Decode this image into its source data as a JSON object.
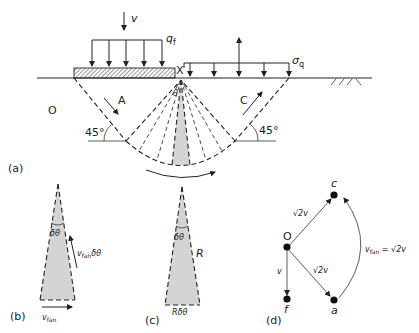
{
  "figure": {
    "panel_a": {
      "label": "(a)",
      "load_velocity": "v",
      "footing_pressure": "q",
      "footing_pressure_sub": "f",
      "point_x": "X",
      "surcharge": "σ",
      "surcharge_sub": "q",
      "origin": "O",
      "zone_a": "A",
      "zone_c": "C",
      "fan_angle": "θ",
      "angle_left": "45°",
      "angle_right": "45°"
    },
    "panel_b": {
      "label": "(b)",
      "wedge_angle": "δθ",
      "side_velocity": "v",
      "side_velocity_sub": "fan",
      "side_velocity_suffix": "δθ",
      "base_velocity": "v",
      "base_velocity_sub": "fan"
    },
    "panel_c": {
      "label": "(c)",
      "wedge_angle": "δθ",
      "radius": "R",
      "arc_length": "Rδθ"
    },
    "panel_d": {
      "label": "(d)",
      "node_o": "O",
      "node_c": "c",
      "node_a": "a",
      "node_f": "f",
      "edge_oc": "√2v",
      "edge_oa": "√2v",
      "edge_of": "v",
      "edge_ac_prefix": "v",
      "edge_ac_sub": "fan",
      "edge_ac_suffix": " = √2v"
    },
    "colors": {
      "ink": "#222222",
      "shade": "#d4d4d4",
      "background": "#ffffff"
    }
  }
}
